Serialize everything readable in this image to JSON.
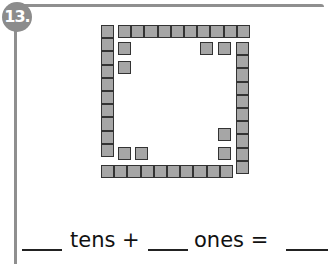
{
  "problem": {
    "number_label": "13.",
    "badge_color": "#8c8c8c",
    "frame_color": "#8f8f8f"
  },
  "figure": {
    "cube_color": "#a6a6a6",
    "cube_border": "#333333",
    "tens_rods": [
      {
        "orientation": "vertical",
        "x": 101,
        "y": 25,
        "count": 10
      },
      {
        "orientation": "horizontal",
        "x": 118,
        "y": 25,
        "count": 10
      },
      {
        "orientation": "vertical",
        "x": 236,
        "y": 42,
        "count": 10
      },
      {
        "orientation": "horizontal",
        "x": 101,
        "y": 165,
        "count": 10
      }
    ],
    "ones_cubes": [
      {
        "x": 118,
        "y": 42
      },
      {
        "x": 118,
        "y": 61
      },
      {
        "x": 200,
        "y": 42
      },
      {
        "x": 218,
        "y": 42
      },
      {
        "x": 218,
        "y": 128
      },
      {
        "x": 218,
        "y": 147
      },
      {
        "x": 118,
        "y": 147
      },
      {
        "x": 135,
        "y": 147
      }
    ]
  },
  "equation": {
    "tens_word": "tens +",
    "ones_word": "ones =",
    "blanks": [
      "",
      "",
      ""
    ]
  }
}
